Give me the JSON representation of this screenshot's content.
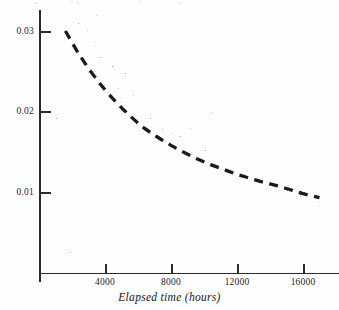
{
  "chart_data": {
    "type": "line",
    "title": "",
    "xlabel": "Elapsed time (hours)",
    "ylabel": "",
    "grid": false,
    "legend": null,
    "xlim": [
      800,
      17000
    ],
    "ylim": [
      0,
      0.0334
    ],
    "xticks": [
      {
        "value": 4000,
        "label": "4000"
      },
      {
        "value": 8000,
        "label": "8000"
      },
      {
        "value": 12000,
        "label": "12000"
      },
      {
        "value": 16000,
        "label": "16000"
      }
    ],
    "yticks": [
      {
        "value": 0.03,
        "label": "0.03"
      },
      {
        "value": 0.02,
        "label": "0.02"
      },
      {
        "value": 0.01,
        "label": "0.01"
      }
    ],
    "series": [
      {
        "name": "fitted decay curve",
        "style": "dashed",
        "color": "#1b1b1b",
        "x": [
          1600,
          2400,
          3200,
          4000,
          4800,
          5600,
          6400,
          7200,
          8000,
          8800,
          9600,
          10400,
          11200,
          12000,
          12800,
          13600,
          14400,
          15200,
          16000,
          17000
        ],
        "y": [
          0.03,
          0.0272,
          0.0248,
          0.0227,
          0.0209,
          0.0193,
          0.0179,
          0.0168,
          0.0158,
          0.0149,
          0.0141,
          0.0134,
          0.0128,
          0.0122,
          0.0117,
          0.0112,
          0.0108,
          0.0103,
          0.0098,
          0.0093
        ]
      }
    ]
  },
  "axes": {
    "x_axis_label": "Elapsed time (hours)",
    "x_tick_labels": [
      "4000",
      "8000",
      "12000",
      "16000"
    ],
    "y_tick_labels": [
      "0.03",
      "0.02",
      "0.01"
    ]
  }
}
